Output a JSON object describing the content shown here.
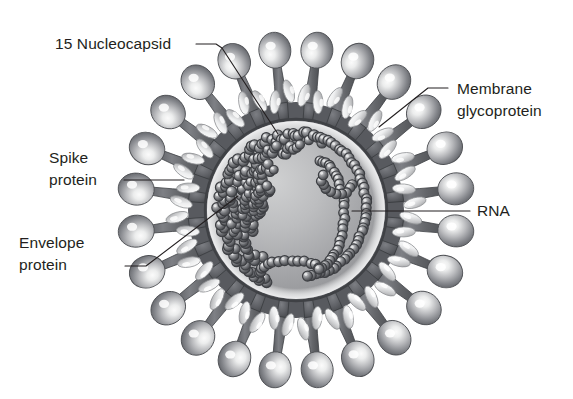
{
  "figure": {
    "kind": "diagram",
    "background_color": "#ffffff",
    "style": "grayscale scientific illustration",
    "center": {
      "x": 296,
      "y": 210
    },
    "palette": {
      "text": "#231f20",
      "leader_line": "#231f20",
      "envelope_dark": "#55565a",
      "envelope_mid": "#6e7076",
      "envelope_light": "#e8e9ea",
      "interior_light": "#d8d9da",
      "interior_mid": "#a9aaac",
      "interior_dark": "#8b8d90",
      "bead_dark": "#4a4b4f",
      "bead_light": "#c9cacc",
      "spike_stalk": "#6a6c71",
      "spike_head_light": "#f2f2f3",
      "spike_head_dark": "#5e6064"
    }
  },
  "labels": [
    {
      "id": "nucleocapsid",
      "text": "15 Nucleocapsid",
      "text_x": 55,
      "text_y": 49,
      "anchor": "start",
      "leader": "M 196 44 L 216 44 L 222 48 L 278 134",
      "target": {
        "x": 278,
        "y": 134
      }
    },
    {
      "id": "membrane-glycoprotein",
      "line1": "Membrane",
      "line2": "glycoprotein",
      "text_x": 457,
      "text_y": 94,
      "line2_y": 116,
      "anchor": "start",
      "leader": "M 448 88 L 428 88 L 379 127",
      "target": {
        "x": 379,
        "y": 127
      }
    },
    {
      "id": "spike-protein",
      "line1": "Spike",
      "line2": "protein",
      "text_x": 49,
      "text_y": 163,
      "line2_y": 185,
      "anchor": "start",
      "leader": "M 124 180 L 184 180",
      "target": {
        "x": 184,
        "y": 180
      }
    },
    {
      "id": "rna",
      "text": "RNA",
      "text_x": 477,
      "text_y": 216,
      "anchor": "start",
      "leader": "M 470 211 L 352 211",
      "target": {
        "x": 352,
        "y": 211
      }
    },
    {
      "id": "envelope-protein",
      "line1": "Envelope",
      "line2": "protein",
      "text_x": 19,
      "text_y": 248,
      "line2_y": 270,
      "anchor": "start",
      "leader": "M 125 266 L 146 266 L 238 196",
      "target": {
        "x": 238,
        "y": 196
      }
    }
  ],
  "structure": {
    "envelope": {
      "outer_radius": 108,
      "inner_radius": 90,
      "segment_count": 24,
      "description": "dark gray lipid bilayer ring segmented by radial membrane proteins"
    },
    "interior": {
      "radius": 88,
      "description": "light gray gradient core containing the nucleocapsid / RNA bead chains"
    },
    "spikes": {
      "count": 24,
      "stalk_length": 52,
      "head_radius": 17,
      "description": "club shaped peplomers, bulbous light head on a tapered dark stalk"
    },
    "membrane_glycoproteins": {
      "count": 48,
      "description": "pale elongated ovals studding the envelope ring, angled radially"
    },
    "nucleocapsid_beads": {
      "description": "dark spheres with pale highlight forming clustered chains just inside the envelope"
    }
  }
}
